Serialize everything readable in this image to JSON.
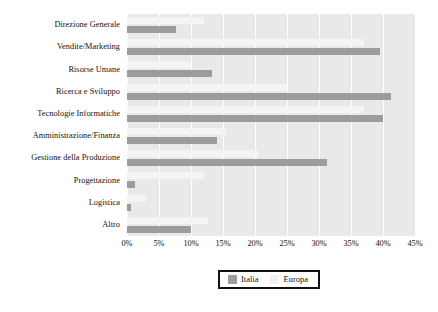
{
  "chart_data": {
    "type": "bar",
    "orientation": "horizontal",
    "title": "",
    "xlabel": "",
    "ylabel": "",
    "xlim": [
      0,
      45
    ],
    "xtick_labels": [
      "0%",
      "5%",
      "10%",
      "15%",
      "20%",
      "25%",
      "30%",
      "35%",
      "40%",
      "45%"
    ],
    "xtick_values": [
      0,
      5,
      10,
      15,
      20,
      25,
      30,
      35,
      40,
      45
    ],
    "grid": true,
    "legend_position": "bottom",
    "categories": [
      "Direzione Generale",
      "Vendite/Marketing",
      "Risorse Umane",
      "Ricerca e Sviluppo",
      "Tecnologie Informatiche",
      "Amministrazione/Finanza",
      "Gestione della Produzione",
      "Progettazione",
      "Logistica",
      "Altro"
    ],
    "series": [
      {
        "name": "Italia",
        "color": "#9c9c9c",
        "values": [
          7.6,
          39.6,
          13.3,
          41.3,
          40.0,
          14.0,
          31.3,
          1.3,
          0.6,
          10.0
        ]
      },
      {
        "name": "Europa",
        "color": "#f4f4f4",
        "values": [
          12.0,
          37.0,
          10.0,
          25.0,
          37.0,
          15.5,
          20.4,
          12.0,
          3.0,
          12.7
        ]
      }
    ]
  },
  "legend": {
    "items": [
      {
        "label": "Italia",
        "color": "#9c9c9c"
      },
      {
        "label": "Europa",
        "color": "#f1f1f1"
      }
    ]
  }
}
